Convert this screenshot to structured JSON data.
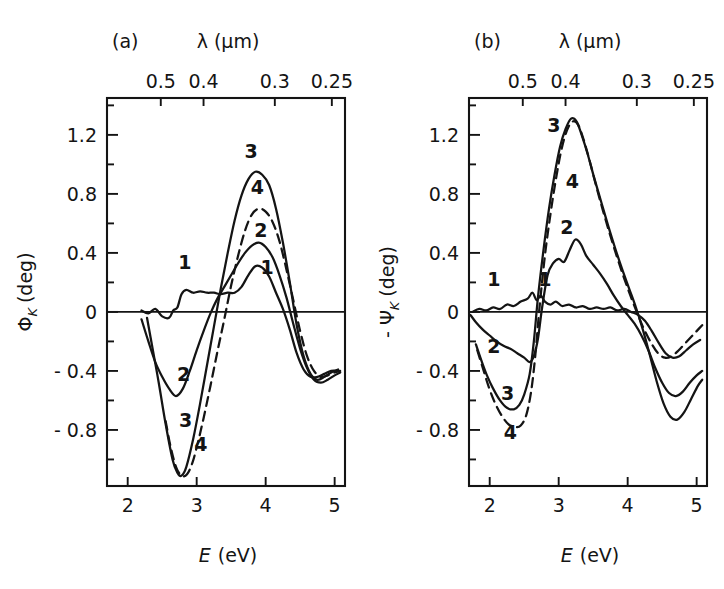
{
  "figure": {
    "background": "#ffffff",
    "ink_color": "#141414",
    "width": 724,
    "height": 589
  },
  "panels": [
    {
      "tag": "(a)",
      "name": "kerr-rotation-panel",
      "top_axis": {
        "title": "λ (μm)",
        "title_symbol": "λ",
        "title_unit": "(μm)",
        "tick_labels": [
          "0.5",
          "0.4",
          "0.3",
          "0.25"
        ],
        "tick_values": [
          0.5,
          0.4,
          0.3,
          0.25
        ]
      },
      "bottom_axis": {
        "title": "E (eV)",
        "title_symbol": "E",
        "title_unit": "(eV)",
        "tick_labels": [
          "2",
          "3",
          "4",
          "5"
        ],
        "tick_values": [
          2,
          3,
          4,
          5
        ],
        "range": [
          1.7,
          5.15
        ]
      },
      "left_axis": {
        "title": "Φ",
        "title_sub": "K",
        "title_unit": "(deg)",
        "title_full": "Φ_K (deg)",
        "tick_labels": [
          "1.2",
          "0.8",
          "0.4",
          "0",
          "- 0.4",
          "- 0.8"
        ],
        "tick_values": [
          1.2,
          0.8,
          0.4,
          0,
          -0.4,
          -0.8
        ],
        "minor_tick_values": [
          1.4,
          1.0,
          0.6,
          0.2,
          -0.2,
          -0.6,
          -1.0
        ],
        "range": [
          -1.18,
          1.45
        ]
      },
      "curve_labels": [
        {
          "text": "1",
          "x": 2.83,
          "y": 0.29
        },
        {
          "text": "1",
          "x": 4.02,
          "y": 0.255
        },
        {
          "text": "2",
          "x": 2.81,
          "y": -0.47
        },
        {
          "text": "2",
          "x": 3.93,
          "y": 0.505
        },
        {
          "text": "3",
          "x": 2.84,
          "y": -0.78
        },
        {
          "text": "3",
          "x": 3.79,
          "y": 1.04
        },
        {
          "text": "4",
          "x": 3.06,
          "y": -0.94
        },
        {
          "text": "4",
          "x": 3.88,
          "y": 0.8
        }
      ]
    },
    {
      "tag": "(b)",
      "name": "kerr-ellipticity-panel",
      "top_axis": {
        "title": "λ (μm)",
        "title_symbol": "λ",
        "title_unit": "(μm)",
        "tick_labels": [
          "0.5",
          "0.4",
          "0.3",
          "0.25"
        ],
        "tick_values": [
          0.5,
          0.4,
          0.3,
          0.25
        ]
      },
      "bottom_axis": {
        "title": "E (eV)",
        "title_symbol": "E",
        "title_unit": "(eV)",
        "tick_labels": [
          "2",
          "3",
          "4",
          "5"
        ],
        "tick_values": [
          2,
          3,
          4,
          5
        ],
        "range": [
          1.7,
          5.15
        ]
      },
      "left_axis": {
        "title": "- Ψ",
        "title_sub": "K",
        "title_unit": "(deg)",
        "title_full": "- Ψ_K (deg)",
        "tick_labels": [
          "1.2",
          "0.8",
          "0.4",
          "0",
          "- 0.4",
          "- 0.8"
        ],
        "tick_values": [
          1.2,
          0.8,
          0.4,
          0,
          -0.4,
          -0.8
        ],
        "minor_tick_values": [
          1.4,
          1.0,
          0.6,
          0.2,
          -0.2,
          -0.6,
          -1.0
        ],
        "range": [
          -1.18,
          1.45
        ]
      },
      "curve_labels": [
        {
          "text": "1",
          "x": 2.06,
          "y": 0.175
        },
        {
          "text": "1",
          "x": 2.8,
          "y": 0.175
        },
        {
          "text": "2",
          "x": 2.06,
          "y": -0.28
        },
        {
          "text": "2",
          "x": 3.12,
          "y": 0.53
        },
        {
          "text": "3",
          "x": 2.26,
          "y": -0.6
        },
        {
          "text": "3",
          "x": 2.93,
          "y": 1.22
        },
        {
          "text": "4",
          "x": 2.3,
          "y": -0.86
        },
        {
          "text": "4",
          "x": 3.2,
          "y": 0.84
        }
      ]
    }
  ],
  "chart_data": [
    {
      "type": "line",
      "name": "panel-a-kerr-rotation",
      "title": "(a)",
      "xlabel": "E (eV)",
      "ylabel": "Φ_K (deg)",
      "xlim": [
        1.7,
        5.15
      ],
      "ylim": [
        -1.18,
        1.45
      ],
      "xticks": [
        2,
        3,
        4,
        5
      ],
      "yticks": [
        -0.8,
        -0.4,
        0,
        0.4,
        0.8,
        1.2
      ],
      "secondary_xaxis": {
        "label": "λ (μm)",
        "ticks": [
          0.5,
          0.4,
          0.3,
          0.25
        ]
      },
      "grid": false,
      "legend": "inline-curve-numbers",
      "series": [
        {
          "name": "1",
          "style": "solid",
          "x": [
            2.2,
            2.3,
            2.4,
            2.5,
            2.6,
            2.66,
            2.72,
            2.78,
            2.85,
            2.95,
            3.05,
            3.15,
            3.25,
            3.35,
            3.45,
            3.55,
            3.65,
            3.75,
            3.85,
            3.95,
            4.05,
            4.15,
            4.25,
            4.35,
            4.45,
            4.55,
            4.65,
            4.75,
            4.85,
            4.95,
            5.05
          ],
          "y": [
            0.01,
            -0.01,
            0.02,
            -0.03,
            -0.04,
            0.01,
            0.03,
            0.12,
            0.15,
            0.13,
            0.14,
            0.13,
            0.13,
            0.12,
            0.13,
            0.13,
            0.17,
            0.25,
            0.31,
            0.3,
            0.24,
            0.13,
            0.02,
            -0.12,
            -0.28,
            -0.39,
            -0.44,
            -0.44,
            -0.42,
            -0.4,
            -0.4
          ]
        },
        {
          "name": "2",
          "style": "solid",
          "x": [
            2.2,
            2.3,
            2.4,
            2.5,
            2.6,
            2.7,
            2.8,
            2.9,
            3.0,
            3.1,
            3.2,
            3.3,
            3.4,
            3.5,
            3.6,
            3.7,
            3.8,
            3.9,
            4.0,
            4.1,
            4.2,
            4.3,
            4.4,
            4.5,
            4.6,
            4.7,
            4.8,
            4.9,
            5.0,
            5.08
          ],
          "y": [
            -0.05,
            -0.2,
            -0.34,
            -0.44,
            -0.52,
            -0.57,
            -0.52,
            -0.4,
            -0.26,
            -0.13,
            -0.01,
            0.09,
            0.17,
            0.25,
            0.33,
            0.4,
            0.45,
            0.47,
            0.44,
            0.37,
            0.25,
            0.1,
            -0.08,
            -0.25,
            -0.38,
            -0.46,
            -0.48,
            -0.46,
            -0.43,
            -0.41
          ]
        },
        {
          "name": "3",
          "style": "solid",
          "x": [
            2.28,
            2.35,
            2.45,
            2.55,
            2.65,
            2.72,
            2.78,
            2.85,
            2.95,
            3.05,
            3.15,
            3.25,
            3.35,
            3.45,
            3.55,
            3.65,
            3.75,
            3.85,
            3.95,
            4.05,
            4.15,
            4.25,
            4.35,
            4.45,
            4.55,
            4.65,
            4.75,
            4.85,
            4.95,
            5.05
          ],
          "y": [
            -0.04,
            -0.22,
            -0.48,
            -0.76,
            -1.0,
            -1.09,
            -1.11,
            -1.05,
            -0.86,
            -0.62,
            -0.36,
            -0.1,
            0.16,
            0.4,
            0.62,
            0.79,
            0.9,
            0.95,
            0.93,
            0.86,
            0.7,
            0.47,
            0.2,
            -0.09,
            -0.3,
            -0.42,
            -0.46,
            -0.44,
            -0.41,
            -0.39
          ]
        },
        {
          "name": "4",
          "style": "dashed",
          "x": [
            2.55,
            2.62,
            2.7,
            2.78,
            2.86,
            2.94,
            3.02,
            3.1,
            3.2,
            3.3,
            3.4,
            3.5,
            3.6,
            3.7,
            3.8,
            3.9,
            4.0,
            4.1,
            4.2,
            4.3,
            4.4,
            4.5,
            4.6,
            4.7,
            4.8,
            4.9,
            5.0,
            5.08
          ],
          "y": [
            -0.74,
            -0.91,
            -1.05,
            -1.11,
            -1.1,
            -1.02,
            -0.88,
            -0.72,
            -0.5,
            -0.27,
            -0.05,
            0.18,
            0.38,
            0.55,
            0.66,
            0.7,
            0.68,
            0.61,
            0.48,
            0.29,
            0.08,
            -0.13,
            -0.3,
            -0.4,
            -0.44,
            -0.43,
            -0.41,
            -0.4
          ]
        }
      ]
    },
    {
      "type": "line",
      "name": "panel-b-kerr-ellipticity",
      "title": "(b)",
      "xlabel": "E (eV)",
      "ylabel": "- Ψ_K (deg)",
      "xlim": [
        1.7,
        5.15
      ],
      "ylim": [
        -1.18,
        1.45
      ],
      "xticks": [
        2,
        3,
        4,
        5
      ],
      "yticks": [
        -0.8,
        -0.4,
        0,
        0.4,
        0.8,
        1.2
      ],
      "secondary_xaxis": {
        "label": "λ (μm)",
        "ticks": [
          0.5,
          0.4,
          0.3,
          0.25
        ]
      },
      "grid": false,
      "legend": "inline-curve-numbers",
      "series": [
        {
          "name": "1",
          "style": "solid",
          "x": [
            1.75,
            1.85,
            1.95,
            2.05,
            2.15,
            2.25,
            2.35,
            2.45,
            2.55,
            2.62,
            2.68,
            2.74,
            2.8,
            2.88,
            2.96,
            3.05,
            3.15,
            3.25,
            3.35,
            3.45,
            3.55,
            3.65,
            3.75,
            3.85,
            3.95,
            4.05,
            4.15,
            4.25,
            4.35,
            4.45,
            4.55,
            4.65,
            4.75,
            4.85,
            4.95,
            5.05
          ],
          "y": [
            0.0,
            0.02,
            0.01,
            0.03,
            0.02,
            0.05,
            0.04,
            0.07,
            0.09,
            0.13,
            0.08,
            0.11,
            0.07,
            0.05,
            0.07,
            0.04,
            0.05,
            0.03,
            0.04,
            0.02,
            0.03,
            0.02,
            0.03,
            0.01,
            0.02,
            0.0,
            -0.02,
            -0.06,
            -0.13,
            -0.21,
            -0.28,
            -0.31,
            -0.3,
            -0.26,
            -0.22,
            -0.19
          ]
        },
        {
          "name": "2",
          "style": "solid",
          "x": [
            1.72,
            1.8,
            1.9,
            2.0,
            2.1,
            2.2,
            2.3,
            2.4,
            2.5,
            2.58,
            2.64,
            2.7,
            2.76,
            2.84,
            2.92,
            3.0,
            3.08,
            3.16,
            3.24,
            3.32,
            3.4,
            3.5,
            3.6,
            3.7,
            3.8,
            3.9,
            4.0,
            4.1,
            4.2,
            4.3,
            4.4,
            4.5,
            4.6,
            4.7,
            4.8,
            4.9,
            5.0,
            5.08
          ],
          "y": [
            -0.02,
            -0.07,
            -0.12,
            -0.16,
            -0.2,
            -0.23,
            -0.25,
            -0.28,
            -0.31,
            -0.34,
            -0.3,
            -0.18,
            0.03,
            0.25,
            0.33,
            0.36,
            0.34,
            0.42,
            0.49,
            0.46,
            0.38,
            0.32,
            0.26,
            0.19,
            0.11,
            0.04,
            -0.02,
            -0.08,
            -0.16,
            -0.26,
            -0.38,
            -0.48,
            -0.55,
            -0.57,
            -0.54,
            -0.48,
            -0.43,
            -0.4
          ]
        },
        {
          "name": "3",
          "style": "solid",
          "x": [
            1.8,
            1.88,
            1.96,
            2.05,
            2.15,
            2.25,
            2.35,
            2.43,
            2.5,
            2.58,
            2.64,
            2.7,
            2.78,
            2.86,
            2.94,
            3.02,
            3.1,
            3.18,
            3.26,
            3.34,
            3.42,
            3.52,
            3.62,
            3.72,
            3.82,
            3.92,
            4.02,
            4.12,
            4.22,
            4.32,
            4.42,
            4.52,
            4.62,
            4.72,
            4.82,
            4.92,
            5.02,
            5.08
          ],
          "y": [
            -0.22,
            -0.33,
            -0.43,
            -0.52,
            -0.6,
            -0.65,
            -0.66,
            -0.63,
            -0.56,
            -0.42,
            -0.2,
            0.1,
            0.42,
            0.7,
            0.93,
            1.12,
            1.24,
            1.31,
            1.29,
            1.19,
            1.07,
            0.9,
            0.74,
            0.58,
            0.43,
            0.29,
            0.16,
            0.03,
            -0.12,
            -0.29,
            -0.47,
            -0.62,
            -0.71,
            -0.73,
            -0.68,
            -0.59,
            -0.5,
            -0.46
          ]
        },
        {
          "name": "4",
          "style": "dashed",
          "x": [
            1.82,
            1.9,
            1.98,
            2.07,
            2.17,
            2.27,
            2.37,
            2.45,
            2.53,
            2.6,
            2.66,
            2.72,
            2.8,
            2.88,
            2.96,
            3.04,
            3.12,
            3.2,
            3.28,
            3.36,
            3.44,
            3.54,
            3.64,
            3.74,
            3.84,
            3.94,
            4.04,
            4.14,
            4.24,
            4.34,
            4.44,
            4.54,
            4.64,
            4.74,
            4.84,
            4.94,
            5.04,
            5.08
          ],
          "y": [
            -0.26,
            -0.38,
            -0.5,
            -0.61,
            -0.7,
            -0.76,
            -0.78,
            -0.77,
            -0.7,
            -0.54,
            -0.3,
            0.02,
            0.38,
            0.66,
            0.9,
            1.1,
            1.23,
            1.29,
            1.27,
            1.17,
            1.04,
            0.86,
            0.69,
            0.53,
            0.38,
            0.24,
            0.11,
            -0.01,
            -0.12,
            -0.21,
            -0.28,
            -0.31,
            -0.3,
            -0.26,
            -0.21,
            -0.16,
            -0.11,
            -0.09
          ]
        }
      ]
    }
  ]
}
